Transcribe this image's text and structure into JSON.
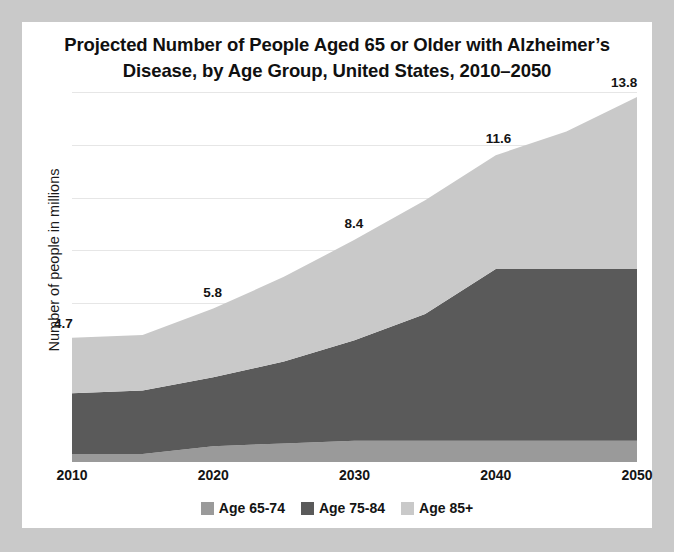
{
  "figure": {
    "title": "Projected Number of People Aged 65 or Older with Alzheimer’s Disease, by  Age Group, United States, 2010–2050",
    "title_line1": "Projected Number of People Aged 65 or Older with Alzheimer’s",
    "title_line2": "Disease, by  Age Group, United States, 2010–2050",
    "background_color": "#c9c9c9",
    "card_color": "#ffffff"
  },
  "chart_data": {
    "type": "area",
    "stacked": true,
    "title": "Projected Number of People Aged 65 or Older with Alzheimer’s Disease, by  Age Group, United States, 2010–2050",
    "xlabel": "",
    "ylabel": "Number of people in millions",
    "x": [
      2010,
      2015,
      2020,
      2025,
      2030,
      2035,
      2040,
      2045,
      2050
    ],
    "xlim": [
      2010,
      2050
    ],
    "ylim": [
      0,
      13.8
    ],
    "grid": true,
    "gridlines": [
      6,
      8,
      10,
      12,
      14
    ],
    "legend_position": "bottom",
    "series": [
      {
        "name": "Age 65-74",
        "color": "#9a9a9a",
        "values": [
          0.3,
          0.3,
          0.6,
          0.7,
          0.8,
          0.8,
          0.8,
          0.8,
          0.8
        ]
      },
      {
        "name": "Age 75-84",
        "color": "#5a5a5a",
        "values": [
          2.3,
          2.4,
          2.6,
          3.1,
          3.8,
          4.8,
          6.5,
          6.5,
          6.5
        ]
      },
      {
        "name": "Age 85+",
        "color": "#c9c9c9",
        "values": [
          2.1,
          2.1,
          2.6,
          3.2,
          3.8,
          4.3,
          4.3,
          5.2,
          6.5
        ]
      }
    ],
    "totals": [
      4.7,
      4.8,
      5.8,
      7.0,
      8.4,
      9.9,
      11.6,
      12.5,
      13.8
    ],
    "data_labels": [
      {
        "year": 2010,
        "value": "4.7"
      },
      {
        "year": 2020,
        "value": "5.8"
      },
      {
        "year": 2030,
        "value": "8.4"
      },
      {
        "year": 2040,
        "value": "11.6"
      },
      {
        "year": 2050,
        "value": "13.8"
      }
    ],
    "xticks": [
      "2010",
      "2020",
      "2030",
      "2040",
      "2050"
    ],
    "legend": [
      {
        "label": "Age 65-74",
        "color": "#9a9a9a"
      },
      {
        "label": "Age 75-84",
        "color": "#5a5a5a"
      },
      {
        "label": "Age 85+",
        "color": "#c9c9c9"
      }
    ]
  }
}
